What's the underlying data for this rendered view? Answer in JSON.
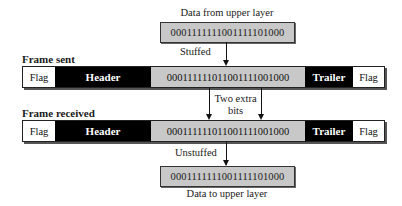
{
  "top": {
    "label": "Data from upper layer",
    "bits": "0001111111001111101000",
    "arrow_label": "Stuffed"
  },
  "frame_sent": {
    "title": "Frame sent",
    "cells": {
      "flag_left": "Flag",
      "header": "Header",
      "payload": "000111111011001111001000",
      "trailer": "Trailer",
      "flag_right": "Flag"
    }
  },
  "annotation": {
    "line1": "Two extra",
    "line2": "bits"
  },
  "frame_received": {
    "title": "Frame received",
    "cells": {
      "flag_left": "Flag",
      "header": "Header",
      "payload": "000111111011001111001000",
      "trailer": "Trailer",
      "flag_right": "Flag"
    }
  },
  "bottom": {
    "arrow_label": "Unstuffed",
    "bits": "0001111111001111101000",
    "label": "Data to upper layer"
  },
  "colors": {
    "payload_fill": "#c8c8c8",
    "header_fill": "#000000",
    "flag_fill": "#ffffff"
  }
}
